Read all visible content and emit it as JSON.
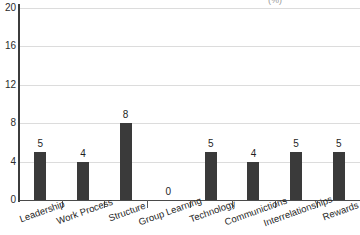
{
  "chart_data": {
    "type": "bar",
    "title": "(%)",
    "title_note": "title is cropped off at the top edge of the screenshot; only a faint fragment is visible",
    "xlabel": "",
    "ylabel": "",
    "categories": [
      "Leadership",
      "Work Process",
      "Structure",
      "Group Learning",
      "Technology",
      "Communictions",
      "Interrelationships",
      "Rewards"
    ],
    "values": [
      5,
      4,
      8,
      0,
      5,
      4,
      5,
      5
    ],
    "value_labels": [
      "5",
      "4",
      "8",
      "0",
      "5",
      "4",
      "5",
      "5"
    ],
    "ylim": [
      0,
      20
    ],
    "yticks": [
      0,
      4,
      8,
      12,
      16,
      20
    ],
    "ytick_labels": [
      "0",
      "4",
      "8",
      "12",
      "16",
      "20"
    ],
    "grid": true,
    "grid_axis": "y",
    "legend": false,
    "legend_position": "none",
    "bar_color": "#3a3a3a",
    "gridline_color": "#dcdcdc",
    "axis_color": "#3c3c3c",
    "background_color": "#ffffff",
    "label_rotation_deg": -20
  }
}
